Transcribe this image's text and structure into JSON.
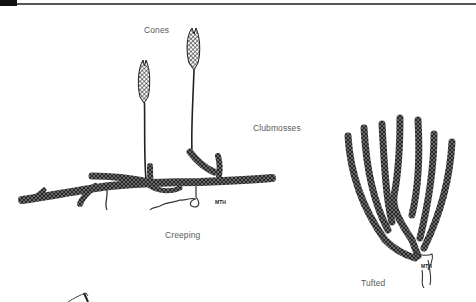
{
  "labels": {
    "cones": "Cones",
    "clubmosses": "Clubmosses",
    "creeping": "Creeping",
    "tufted": "Tufted"
  },
  "signatures": {
    "creeping": "MTH",
    "tufted": "MTH"
  },
  "colors": {
    "ink": "#2a2a2a",
    "label": "#5a5a5a",
    "rule": "#555555",
    "background": "#ffffff"
  }
}
